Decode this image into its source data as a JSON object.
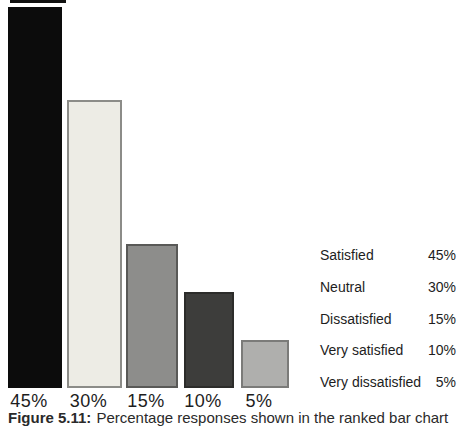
{
  "caption": {
    "number": "Figure 5.11:",
    "text": "Percentage responses shown in the ranked bar chart"
  },
  "colors": {
    "background": "#FFFFFF",
    "text": "#1D1D1D"
  },
  "chart_data": {
    "type": "bar",
    "title": "",
    "xlabel": "",
    "ylabel": "",
    "grid": false,
    "legend_position": "right",
    "ylim": [
      0,
      45
    ],
    "unit": "%",
    "categories": [
      "Satisfied",
      "Neutral",
      "Dissatisfied",
      "Very satisfied",
      "Very dissatisfied"
    ],
    "values": [
      45,
      30,
      15,
      10,
      5
    ],
    "bar_labels": [
      "45%",
      "30%",
      "15%",
      "10%",
      "5%"
    ],
    "bar_fill_colors": [
      "#0C0C0C",
      "#EDECE5",
      "#8D8D8B",
      "#3D3D3B",
      "#AFAFAD"
    ],
    "bar_border_colors": [
      "#0C0C0C",
      "#8C8C88",
      "#595957",
      "#2C2C2A",
      "#7B7B79"
    ],
    "legend": [
      {
        "label": "Satisfied",
        "value": "45%"
      },
      {
        "label": "Neutral",
        "value": "30%"
      },
      {
        "label": "Dissatisfied",
        "value": "15%"
      },
      {
        "label": "Very satisfied",
        "value": "10%"
      },
      {
        "label": "Very dissatisfied",
        "value": "5%"
      }
    ]
  }
}
